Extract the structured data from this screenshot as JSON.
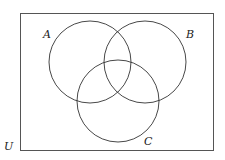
{
  "diagram": {
    "type": "venn",
    "universe_label": "U",
    "sets": [
      {
        "label": "A",
        "cx": 90,
        "cy": 62,
        "r": 41
      },
      {
        "label": "B",
        "cx": 145,
        "cy": 62,
        "r": 41
      },
      {
        "label": "C",
        "cx": 118,
        "cy": 101,
        "r": 41
      }
    ],
    "colors": {
      "stroke": "#333333",
      "background": "#ffffff"
    }
  }
}
